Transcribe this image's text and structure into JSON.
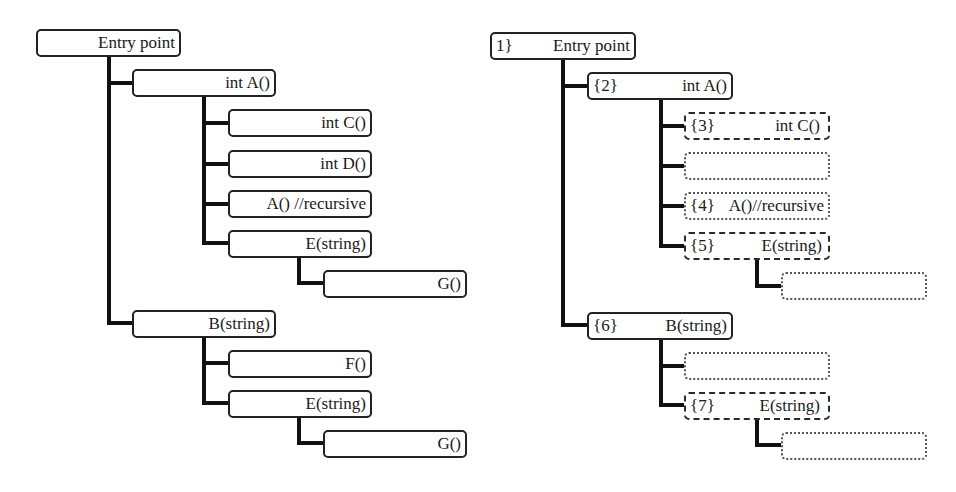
{
  "left_tree": {
    "nodes": [
      {
        "id": "entry",
        "label": "Entry point"
      },
      {
        "id": "a",
        "label": "int A()"
      },
      {
        "id": "c",
        "label": "int C()"
      },
      {
        "id": "d",
        "label": "int D()"
      },
      {
        "id": "a_rec",
        "label": "A() //recursive"
      },
      {
        "id": "e1",
        "label": "E(string)"
      },
      {
        "id": "g1",
        "label": "G()"
      },
      {
        "id": "b",
        "label": "B(string)"
      },
      {
        "id": "f",
        "label": "F()"
      },
      {
        "id": "e2",
        "label": "E(string)"
      },
      {
        "id": "g2",
        "label": "G()"
      }
    ]
  },
  "right_tree": {
    "nodes": [
      {
        "id": "entry",
        "index": "1}",
        "label": "Entry point",
        "style": "solid"
      },
      {
        "id": "a",
        "index": "{2}",
        "label": "int A()",
        "style": "solid"
      },
      {
        "id": "c",
        "index": "{3}",
        "label": "int C()",
        "style": "dash-dot"
      },
      {
        "id": "d",
        "index": "",
        "label": "",
        "style": "dotted"
      },
      {
        "id": "a_rec",
        "index": "{4}",
        "label": "A()//recursive",
        "style": "dotted"
      },
      {
        "id": "e1",
        "index": "{5}",
        "label": "E(string)",
        "style": "dash-dot"
      },
      {
        "id": "g1",
        "index": "",
        "label": "",
        "style": "dotted"
      },
      {
        "id": "b",
        "index": "{6}",
        "label": "B(string)",
        "style": "solid"
      },
      {
        "id": "f",
        "index": "",
        "label": "",
        "style": "dotted"
      },
      {
        "id": "e2",
        "index": "{7}",
        "label": "E(string)",
        "style": "dash-dot"
      },
      {
        "id": "g2",
        "index": "",
        "label": "",
        "style": "dotted"
      }
    ]
  },
  "colors": {
    "line": "#111111",
    "border": "#222222",
    "background": "#ffffff"
  }
}
